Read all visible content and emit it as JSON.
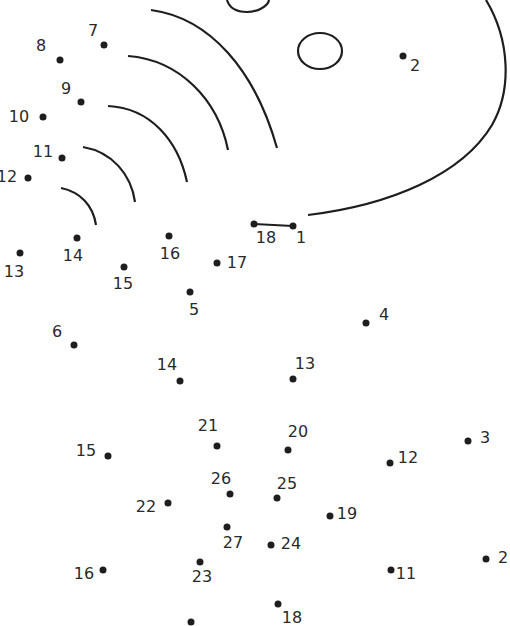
{
  "puzzle": {
    "type": "connect-the-dots",
    "stroke_color": "#1e1e1e",
    "points": [
      {
        "n": "7",
        "x": 104,
        "y": 45,
        "lx": 93,
        "ly": 31
      },
      {
        "n": "8",
        "x": 60,
        "y": 60,
        "lx": 41,
        "ly": 46
      },
      {
        "n": "9",
        "x": 81,
        "y": 102,
        "lx": 66,
        "ly": 89
      },
      {
        "n": "10",
        "x": 43,
        "y": 117,
        "lx": 19,
        "ly": 117
      },
      {
        "n": "11",
        "x": 62,
        "y": 158,
        "lx": 43,
        "ly": 152
      },
      {
        "n": "12",
        "x": 28,
        "y": 178,
        "lx": 7,
        "ly": 177
      },
      {
        "n": "2",
        "x": 403,
        "y": 56,
        "lx": 415,
        "ly": 66
      },
      {
        "n": "18",
        "x": 254,
        "y": 224,
        "lx": 266,
        "ly": 238
      },
      {
        "n": "1",
        "x": 293,
        "y": 226,
        "lx": 301,
        "ly": 238
      },
      {
        "n": "13",
        "x": 20,
        "y": 253,
        "lx": 14,
        "ly": 272
      },
      {
        "n": "14",
        "x": 77,
        "y": 238,
        "lx": 73,
        "ly": 256
      },
      {
        "n": "15",
        "x": 124,
        "y": 267,
        "lx": 123,
        "ly": 284
      },
      {
        "n": "16",
        "x": 169,
        "y": 236,
        "lx": 170,
        "ly": 254
      },
      {
        "n": "17",
        "x": 217,
        "y": 263,
        "lx": 237,
        "ly": 263
      },
      {
        "n": "5",
        "x": 190,
        "y": 292,
        "lx": 194,
        "ly": 310
      },
      {
        "n": "4",
        "x": 366,
        "y": 323,
        "lx": 384,
        "ly": 315
      },
      {
        "n": "6",
        "x": 74,
        "y": 345,
        "lx": 57,
        "ly": 332
      },
      {
        "n": "14",
        "x": 180,
        "y": 381,
        "lx": 167,
        "ly": 365
      },
      {
        "n": "13",
        "x": 293,
        "y": 379,
        "lx": 305,
        "ly": 364
      },
      {
        "n": "21",
        "x": 217,
        "y": 446,
        "lx": 208,
        "ly": 426
      },
      {
        "n": "20",
        "x": 288,
        "y": 450,
        "lx": 298,
        "ly": 432
      },
      {
        "n": "15",
        "x": 108,
        "y": 456,
        "lx": 86,
        "ly": 451
      },
      {
        "n": "3",
        "x": 468,
        "y": 441,
        "lx": 485,
        "ly": 438
      },
      {
        "n": "12",
        "x": 390,
        "y": 463,
        "lx": 408,
        "ly": 458
      },
      {
        "n": "26",
        "x": 230,
        "y": 494,
        "lx": 221,
        "ly": 479
      },
      {
        "n": "25",
        "x": 277,
        "y": 498,
        "lx": 287,
        "ly": 484
      },
      {
        "n": "22",
        "x": 168,
        "y": 503,
        "lx": 146,
        "ly": 507
      },
      {
        "n": "19",
        "x": 330,
        "y": 516,
        "lx": 347,
        "ly": 514
      },
      {
        "n": "27",
        "x": 227,
        "y": 527,
        "lx": 233,
        "ly": 543
      },
      {
        "n": "24",
        "x": 271,
        "y": 545,
        "lx": 291,
        "ly": 544
      },
      {
        "n": "16",
        "x": 103,
        "y": 570,
        "lx": 84,
        "ly": 574
      },
      {
        "n": "23",
        "x": 200,
        "y": 562,
        "lx": 202,
        "ly": 577
      },
      {
        "n": "11",
        "x": 391,
        "y": 570,
        "lx": 406,
        "ly": 574
      },
      {
        "n": "2",
        "x": 486,
        "y": 559,
        "lx": 503,
        "ly": 558
      },
      {
        "n": "18",
        "x": 278,
        "y": 604,
        "lx": 292,
        "ly": 618
      },
      {
        "n": "",
        "x": 191,
        "y": 622,
        "lx": 0,
        "ly": 0
      }
    ]
  }
}
